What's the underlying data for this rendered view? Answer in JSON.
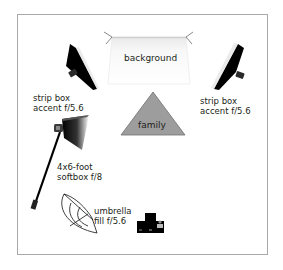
{
  "diagram": {
    "type": "studio lighting setup",
    "elements": {
      "background": {
        "label": "background"
      },
      "subject": {
        "label": "family",
        "color": "#9d9d9d"
      },
      "strip_box_left": {
        "line1": "strip box",
        "line2": "accent f/5.6"
      },
      "strip_box_right": {
        "line1": "strip box",
        "line2": "accent f/5.6"
      },
      "softbox": {
        "line1": "4x6-foot",
        "line2": "softbox f/8"
      },
      "umbrella": {
        "line1": "umbrella",
        "line2": "fill f/5.6"
      },
      "camera": {
        "label": ""
      }
    },
    "colors": {
      "frame": "#a9a9a9",
      "subject_fill": "#9d9d9d",
      "light_fill": "#000000",
      "text": "#231f20"
    }
  }
}
